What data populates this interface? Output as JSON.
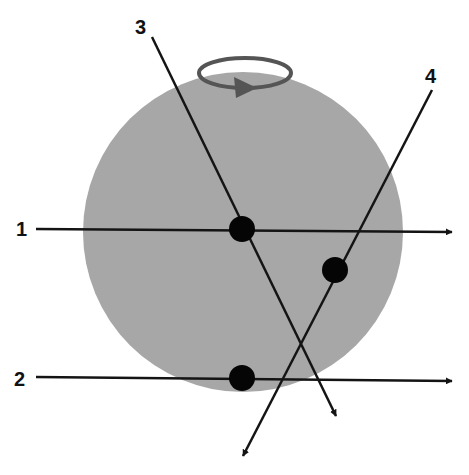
{
  "diagram": {
    "colors": {
      "sphere": "#a7a7a7",
      "line": "#141414",
      "dot": "#050505",
      "rotation_arrow": "#555555",
      "background": "#ffffff"
    },
    "sphere": {
      "cx": 243,
      "cy": 232,
      "r": 160
    },
    "rotation_indicator": {
      "cx": 245,
      "cy": 73,
      "rx": 46,
      "ry": 15,
      "direction": "counter-clockwise-viewed-from-front"
    },
    "lines": [
      {
        "id": "1",
        "label": "1",
        "label_pos": [
          16,
          236
        ],
        "x1": 36,
        "y1": 229,
        "x2": 452,
        "y2": 232
      },
      {
        "id": "2",
        "label": "2",
        "label_pos": [
          14,
          386
        ],
        "x1": 36,
        "y1": 377,
        "x2": 452,
        "y2": 381
      },
      {
        "id": "3",
        "label": "3",
        "label_pos": [
          135,
          34
        ],
        "x1": 152,
        "y1": 37,
        "x2": 336,
        "y2": 416
      },
      {
        "id": "4",
        "label": "4",
        "label_pos": [
          425,
          83
        ],
        "x1": 432,
        "y1": 90,
        "x2": 243,
        "y2": 456
      }
    ],
    "dots": [
      {
        "on_line": "1",
        "cx": 242,
        "cy": 229,
        "r": 13
      },
      {
        "on_line": "4",
        "cx": 335,
        "cy": 270,
        "r": 13
      },
      {
        "on_line": "2",
        "cx": 242,
        "cy": 378,
        "r": 13
      }
    ]
  }
}
